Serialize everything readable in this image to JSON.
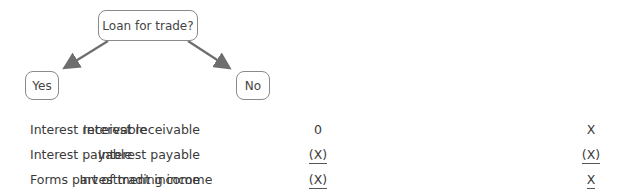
{
  "diagram": {
    "question": "Loan for trade?",
    "branches": [
      {
        "label": "Yes"
      },
      {
        "label": "No"
      }
    ],
    "arrow_color": "#6e6e6e"
  },
  "yes_table": {
    "rows": [
      {
        "label": "Interest receivable",
        "value": "0",
        "underlined": false
      },
      {
        "label": "Interest payable",
        "value": "(X)",
        "underlined": true
      },
      {
        "label": "Forms part of trading income",
        "value": "(X)",
        "underlined": true
      }
    ]
  },
  "no_table": {
    "rows": [
      {
        "label": "Interest receivable",
        "value": "X",
        "underlined": false
      },
      {
        "label": "Interest payable",
        "value": "(X)",
        "underlined": true
      },
      {
        "label": "Investment income",
        "value": "X",
        "underlined": true
      }
    ]
  }
}
